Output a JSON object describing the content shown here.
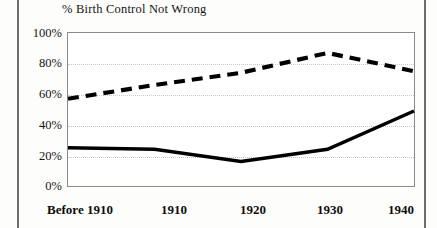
{
  "figure": {
    "name": "birth-control-attitudes-line-chart",
    "background_color": "#ffffff",
    "frame_color": "#8a8a8a",
    "grid_color": "#c9c9c9",
    "page_rule_color": "#6d6d6d"
  },
  "chart_data": {
    "type": "line",
    "title": "% Birth Control Not Wrong",
    "xlabel": "",
    "ylabel": "",
    "categories": [
      "Before 1910",
      "1910",
      "1920",
      "1930",
      "1940"
    ],
    "ytick_labels": [
      "0%",
      "20%",
      "40%",
      "60%",
      "80%",
      "100%"
    ],
    "ytick_values": [
      0,
      20,
      40,
      60,
      80,
      100
    ],
    "ylim": [
      0,
      100
    ],
    "grid": "horizontal-dotted",
    "legend": "none",
    "series": [
      {
        "name": "dashed-series",
        "style": "dashed",
        "color": "#000000",
        "values": [
          57,
          66,
          74,
          87,
          75
        ]
      },
      {
        "name": "solid-series",
        "style": "solid",
        "color": "#000000",
        "values": [
          25,
          24,
          16,
          24,
          49
        ]
      }
    ]
  },
  "axis": {
    "y_ticks": [
      {
        "label": "100%",
        "value": 100
      },
      {
        "label": "80%",
        "value": 80
      },
      {
        "label": "60%",
        "value": 60
      },
      {
        "label": "40%",
        "value": 40
      },
      {
        "label": "20%",
        "value": 20
      },
      {
        "label": "0%",
        "value": 0
      }
    ],
    "x_ticks": [
      {
        "label": "Before 1910"
      },
      {
        "label": "1910"
      },
      {
        "label": "1920"
      },
      {
        "label": "1930"
      },
      {
        "label": "1940"
      }
    ]
  }
}
